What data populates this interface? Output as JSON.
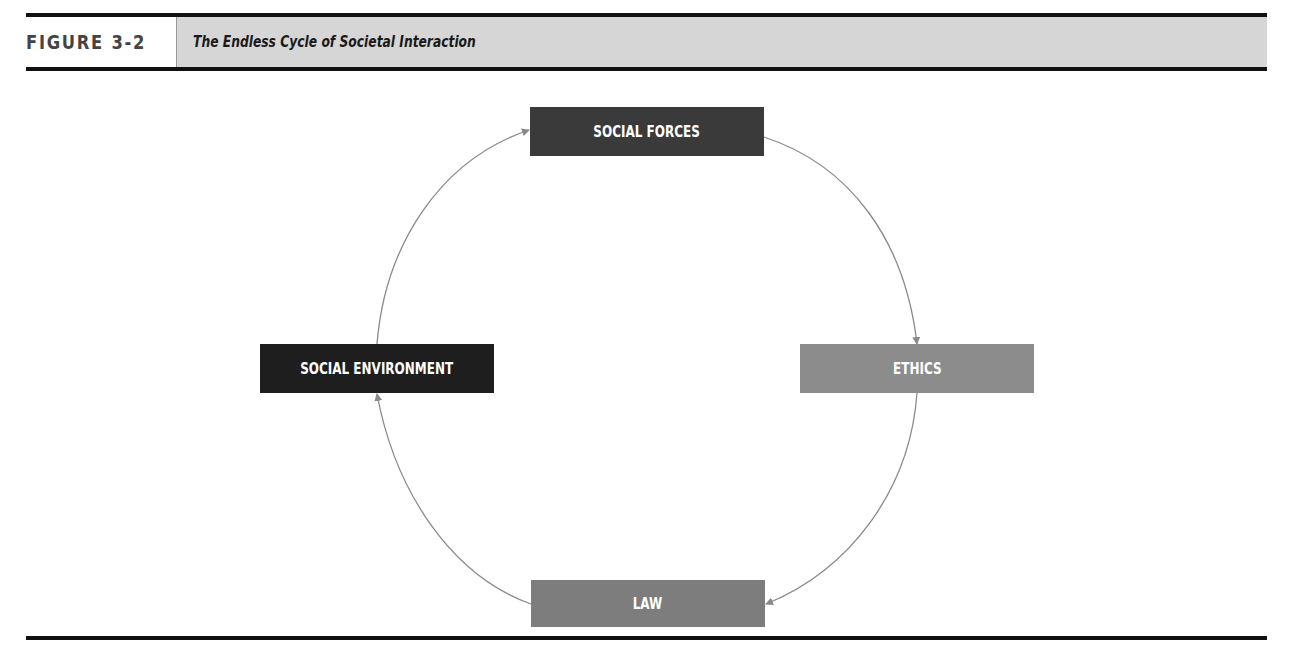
{
  "figure": {
    "label": "FIGURE 3-2",
    "title": "The Endless Cycle of Societal Interaction"
  },
  "diagram": {
    "type": "cycle",
    "direction": "clockwise",
    "nodes": [
      {
        "id": "social_forces",
        "label": "SOCIAL FORCES",
        "color": "#3a3a3a",
        "position": "top"
      },
      {
        "id": "ethics",
        "label": "ETHICS",
        "color": "#8c8c8c",
        "position": "right"
      },
      {
        "id": "law",
        "label": "LAW",
        "color": "#7d7d7d",
        "position": "bottom"
      },
      {
        "id": "social_environment",
        "label": "SOCIAL ENVIRONMENT",
        "color": "#1e1e1e",
        "position": "left"
      }
    ],
    "edges": [
      {
        "from": "social_forces",
        "to": "ethics"
      },
      {
        "from": "ethics",
        "to": "law"
      },
      {
        "from": "law",
        "to": "social_environment"
      },
      {
        "from": "social_environment",
        "to": "social_forces"
      }
    ],
    "arrow_color": "#8a8a8a"
  },
  "colors": {
    "rule": "#111111",
    "title_band": "#d6d6d6",
    "label_text": "#444444"
  }
}
